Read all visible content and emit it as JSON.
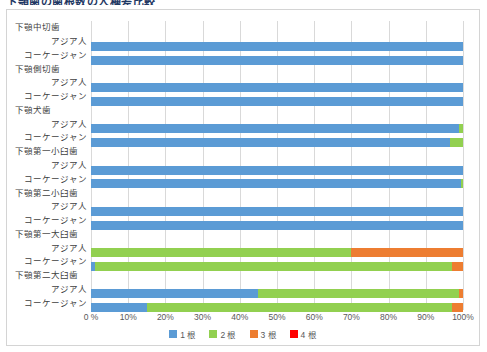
{
  "chart_data": {
    "type": "bar",
    "orientation": "horizontal",
    "stacked": true,
    "normalized_percent": true,
    "title": "下顎歯の歯根数の人種差比較",
    "xlabel": "",
    "ylabel": "",
    "xlim": [
      0,
      100
    ],
    "xticks": [
      0,
      10,
      20,
      30,
      40,
      50,
      60,
      70,
      80,
      90,
      100
    ],
    "xtick_labels": [
      "0 %",
      "10%",
      "20%",
      "30%",
      "40%",
      "50%",
      "60%",
      "70%",
      "80%",
      "90%",
      "100%"
    ],
    "grid": true,
    "legend_position": "bottom",
    "groups": [
      {
        "name": "下顎中切歯",
        "rows": [
          {
            "label": "アジア人",
            "values": [
              100,
              0,
              0,
              0
            ]
          },
          {
            "label": "コーケージャン",
            "values": [
              100,
              0,
              0,
              0
            ]
          }
        ]
      },
      {
        "name": "下顎側切歯",
        "rows": [
          {
            "label": "アジア人",
            "values": [
              100,
              0,
              0,
              0
            ]
          },
          {
            "label": "コーケージャン",
            "values": [
              100,
              0,
              0,
              0
            ]
          }
        ]
      },
      {
        "name": "下顎犬歯",
        "rows": [
          {
            "label": "アジア人",
            "values": [
              99,
              1,
              0,
              0
            ]
          },
          {
            "label": "コーケージャン",
            "values": [
              96.5,
              3.5,
              0,
              0
            ]
          }
        ]
      },
      {
        "name": "下顎第一小臼歯",
        "rows": [
          {
            "label": "アジア人",
            "values": [
              100,
              0,
              0,
              0
            ]
          },
          {
            "label": "コーケージャン",
            "values": [
              99.5,
              0.5,
              0,
              0
            ]
          }
        ]
      },
      {
        "name": "下顎第二小臼歯",
        "rows": [
          {
            "label": "アジア人",
            "values": [
              100,
              0,
              0,
              0
            ]
          },
          {
            "label": "コーケージャン",
            "values": [
              100,
              0,
              0,
              0
            ]
          }
        ]
      },
      {
        "name": "下顎第一大臼歯",
        "rows": [
          {
            "label": "アジア人",
            "values": [
              0,
              70,
              30,
              0
            ]
          },
          {
            "label": "コーケージャン",
            "values": [
              1,
              96,
              3,
              0
            ]
          }
        ]
      },
      {
        "name": "下顎第二大臼歯",
        "rows": [
          {
            "label": "アジア人",
            "values": [
              45,
              54,
              1,
              0
            ]
          },
          {
            "label": "コーケージャン",
            "values": [
              15,
              82,
              3,
              0
            ]
          }
        ]
      }
    ],
    "series": [
      {
        "name": "1 根",
        "color": "#5B9BD5"
      },
      {
        "name": "2 根",
        "color": "#92D050"
      },
      {
        "name": "3 根",
        "color": "#ED7D31"
      },
      {
        "name": "4 根",
        "color": "#FF0000"
      }
    ]
  }
}
